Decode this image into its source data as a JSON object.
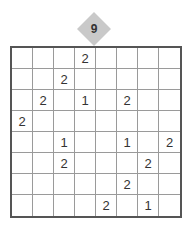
{
  "puzzle": {
    "number": "9",
    "rows": 8,
    "cols": 8,
    "grid": [
      [
        "",
        "",
        "",
        "2",
        "",
        "",
        "",
        ""
      ],
      [
        "",
        "",
        "2",
        "",
        "",
        "",
        "",
        ""
      ],
      [
        "",
        "2",
        "",
        "1",
        "",
        "2",
        "",
        ""
      ],
      [
        "2",
        "",
        "",
        "",
        "",
        "",
        "",
        ""
      ],
      [
        "",
        "",
        "1",
        "",
        "",
        "1",
        "",
        "2"
      ],
      [
        "",
        "",
        "2",
        "",
        "",
        "",
        "2",
        ""
      ],
      [
        "",
        "",
        "",
        "",
        "",
        "2",
        "",
        ""
      ],
      [
        "",
        "",
        "",
        "",
        "2",
        "",
        "1",
        ""
      ]
    ]
  }
}
